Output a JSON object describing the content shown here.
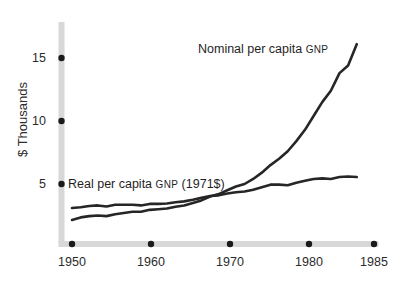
{
  "chart_data": {
    "type": "line",
    "title": "",
    "subtitle": "",
    "xlabel": "",
    "ylabel": "$ Thousands",
    "xlim": [
      1948,
      1986
    ],
    "ylim": [
      0,
      17
    ],
    "grid": false,
    "legend_position": "inline-annotations",
    "x_ticks": [
      1950,
      1960,
      1970,
      1980,
      1985
    ],
    "x_tick_labels": [
      "1950",
      "1960",
      "1970",
      "1980",
      "1985"
    ],
    "y_ticks": [
      5,
      10,
      15
    ],
    "y_tick_labels": [
      "5",
      "10",
      "15"
    ],
    "series": [
      {
        "name": "Real per capita GNP (1971$)",
        "label_prefix": "Real per capita ",
        "label_smallcaps": "GNP",
        "label_suffix": " (1971$)",
        "color": "#262626",
        "x": [
          1950,
          1951,
          1952,
          1953,
          1954,
          1955,
          1956,
          1957,
          1958,
          1959,
          1960,
          1961,
          1962,
          1963,
          1964,
          1965,
          1966,
          1967,
          1968,
          1969,
          1970,
          1971,
          1972,
          1973,
          1974,
          1975,
          1976,
          1977,
          1978,
          1979,
          1980,
          1981,
          1982,
          1983
        ],
        "values": [
          3.1,
          3.15,
          3.25,
          3.3,
          3.22,
          3.35,
          3.35,
          3.35,
          3.3,
          3.42,
          3.42,
          3.45,
          3.55,
          3.62,
          3.75,
          3.9,
          4.05,
          4.1,
          4.25,
          4.35,
          4.4,
          4.55,
          4.75,
          4.95,
          4.95,
          4.9,
          5.1,
          5.25,
          5.4,
          5.45,
          5.4,
          5.55,
          5.6,
          5.55
        ]
      },
      {
        "name": "Nominal per capita GNP",
        "label_prefix": "Nominal per capita ",
        "label_smallcaps": "GNP",
        "label_suffix": "",
        "color": "#262626",
        "x": [
          1950,
          1951,
          1952,
          1953,
          1954,
          1955,
          1956,
          1957,
          1958,
          1959,
          1960,
          1961,
          1962,
          1963,
          1964,
          1965,
          1966,
          1967,
          1968,
          1969,
          1970,
          1971,
          1972,
          1973,
          1974,
          1975,
          1976,
          1977,
          1978,
          1979,
          1980,
          1981,
          1982,
          1983
        ],
        "values": [
          2.15,
          2.35,
          2.45,
          2.5,
          2.45,
          2.6,
          2.7,
          2.8,
          2.8,
          2.95,
          3.0,
          3.05,
          3.2,
          3.3,
          3.5,
          3.7,
          4.0,
          4.2,
          4.5,
          4.8,
          5.0,
          5.4,
          5.9,
          6.5,
          7.0,
          7.6,
          8.4,
          9.3,
          10.4,
          11.5,
          12.4,
          13.8,
          14.4,
          16.1
        ]
      }
    ],
    "annotations": [
      {
        "text": "Nominal per capita GNP",
        "x_px": 198,
        "y_px": 42
      },
      {
        "text": "Real per capita GNP (1971$)",
        "x_px": 68,
        "y_px": 177
      }
    ],
    "axis_band_color": "#d8d8d8",
    "line_color": "#262626",
    "text_color": "#2b2b2b",
    "background_color": "#ffffff"
  }
}
